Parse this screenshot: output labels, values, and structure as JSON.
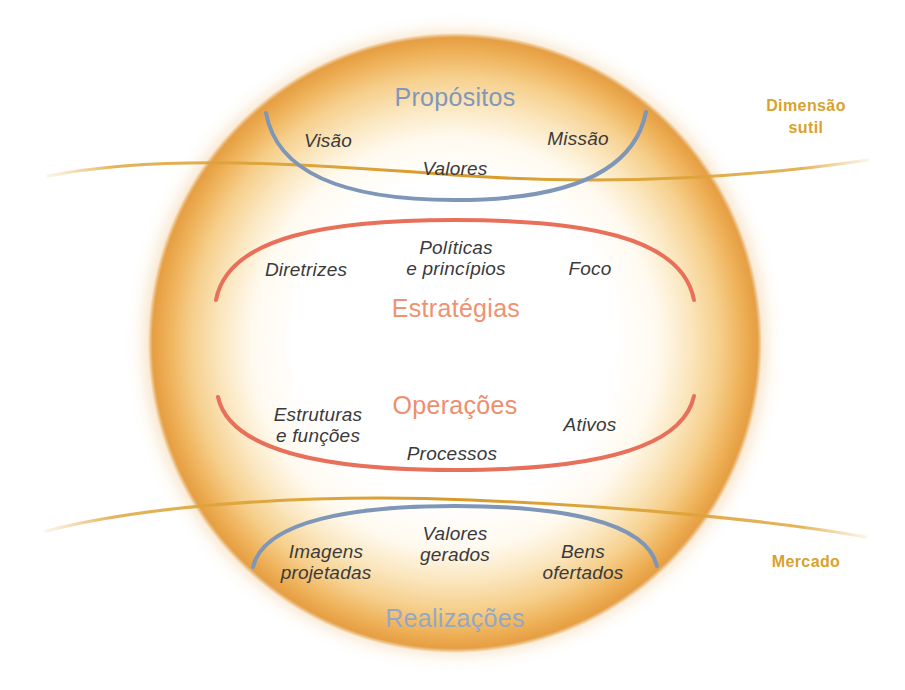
{
  "diagram": {
    "title_text": "",
    "colors": {
      "purpose_blue": "#7e96b8",
      "strategy_orange": "#eb8b72",
      "operations_orange": "#e8715a",
      "gold": "#e0a93c",
      "sphere_amber": "#f0b05a",
      "item_text": "#3a3a3c"
    },
    "sections": [
      {
        "id": "propositos",
        "title": "Propósitos",
        "title_color": "#8097b9",
        "arc_color": "#7e96b8",
        "arc_shape": "bowl",
        "items": [
          {
            "id": "visao",
            "text": "Visão"
          },
          {
            "id": "valores",
            "text": "Valores"
          },
          {
            "id": "missao",
            "text": "Missão"
          }
        ]
      },
      {
        "id": "estrategias",
        "title": "Estratégias",
        "title_color": "#ee9272",
        "arc_color": "#e8705a",
        "arc_shape": "dome",
        "items": [
          {
            "id": "diretrizes",
            "text": "Diretrizes"
          },
          {
            "id": "politicas-e-principios",
            "text": "Políticas\ne princípios"
          },
          {
            "id": "foco",
            "text": "Foco"
          }
        ]
      },
      {
        "id": "operacoes",
        "title": "Operações",
        "title_color": "#ee8e6d",
        "arc_color": "#e8705a",
        "arc_shape": "bowl",
        "items": [
          {
            "id": "estruturas-e-funcoes",
            "text": "Estruturas\ne funções"
          },
          {
            "id": "processos",
            "text": "Processos"
          },
          {
            "id": "ativos",
            "text": "Ativos"
          }
        ]
      },
      {
        "id": "realizacoes",
        "title": "Realizações",
        "title_color": "#93a8c4",
        "arc_color": "#7e96b8",
        "arc_shape": "dome",
        "items": [
          {
            "id": "imagens-projetadas",
            "text": "Imagens\nprojetadas"
          },
          {
            "id": "valores-gerados",
            "text": "Valores\ngerados"
          },
          {
            "id": "bens-ofertados",
            "text": "Bens\nofertados"
          }
        ]
      }
    ],
    "outer_labels": [
      {
        "id": "dimensao-sutil",
        "text": "Dimensão\nsutil",
        "color": "#d9a22e"
      },
      {
        "id": "mercado",
        "text": "Mercado",
        "color": "#d9a22e"
      }
    ]
  }
}
